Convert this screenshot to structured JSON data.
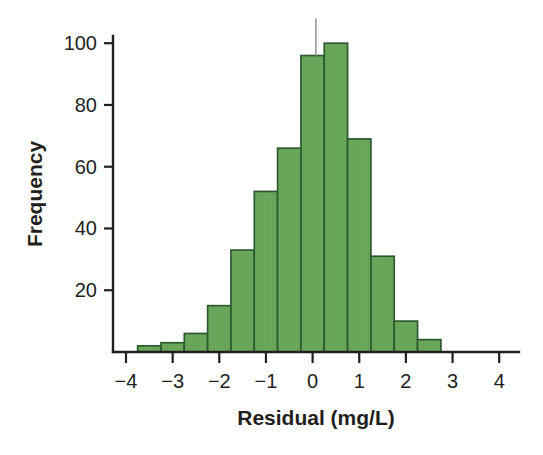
{
  "chart_data": {
    "type": "bar",
    "title": "",
    "subtitle": "",
    "xlabel": "Residual (mg/L)",
    "ylabel": "Frequency",
    "xlim": [
      -4.4,
      4.4
    ],
    "ylim": [
      0,
      108
    ],
    "grid": false,
    "legend": null,
    "bin_width": 0.5,
    "bar_fill_color": "#6ba85c",
    "bar_edge_color": "#2b5a2e",
    "axis_color": "#231f20",
    "marker_color": "#9a9a9a",
    "x_ticks": [
      -4,
      -3,
      -2,
      -1,
      0,
      1,
      2,
      3,
      4
    ],
    "x_tick_labels": [
      "−4",
      "−3",
      "−2",
      "−1",
      "0",
      "1",
      "2",
      "3",
      "4"
    ],
    "y_ticks": [
      20,
      40,
      60,
      80,
      100
    ],
    "y_tick_labels": [
      "20",
      "40",
      "60",
      "80",
      "100"
    ],
    "bin_edges": [
      -3.75,
      -3.25,
      -2.75,
      -2.25,
      -1.75,
      -1.25,
      -0.75,
      -0.25,
      0.25,
      0.75,
      1.25,
      1.75,
      2.25,
      2.75
    ],
    "bin_centers": [
      -3.5,
      -3.0,
      -2.5,
      -2.0,
      -1.5,
      -1.0,
      -0.5,
      0.0,
      0.5,
      1.0,
      1.5,
      2.0,
      2.5
    ],
    "values": [
      2,
      3,
      6,
      15,
      33,
      52,
      66,
      96,
      100,
      69,
      31,
      10,
      4
    ],
    "annotations": [
      {
        "name": "peak-marker-line",
        "type": "vertical-line",
        "x": 0.07,
        "y_from": 96,
        "y_to": 108
      }
    ]
  },
  "figure": {
    "background_color": "#ffffff"
  }
}
